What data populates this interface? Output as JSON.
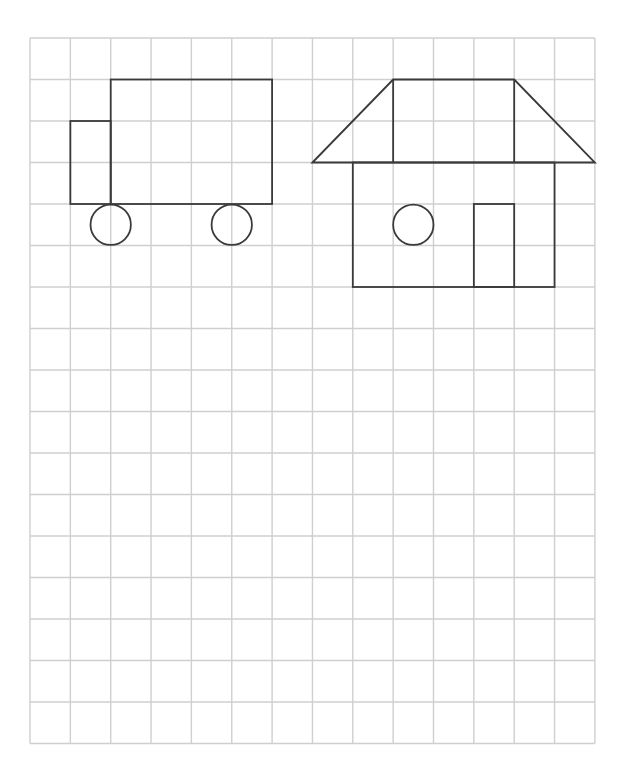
{
  "grid": {
    "left": 30,
    "top": 38,
    "cols": 14,
    "rows": 17,
    "cell_w": 40.35,
    "cell_h": 41.5,
    "line_color": "#cfcfcf",
    "stroke_color": "#3a3a3a"
  },
  "figures": [
    {
      "name": "truck",
      "parts": [
        {
          "type": "rect",
          "name": "truck-cab",
          "x1": 1,
          "y1": 2,
          "x2": 2,
          "y2": 4
        },
        {
          "type": "rect",
          "name": "truck-body",
          "x1": 2,
          "y1": 1,
          "x2": 6,
          "y2": 4
        },
        {
          "type": "circle",
          "name": "truck-wheel-front",
          "cx": 2,
          "cy": 4.5,
          "r": 0.5
        },
        {
          "type": "circle",
          "name": "truck-wheel-rear",
          "cx": 5,
          "cy": 4.5,
          "r": 0.5
        }
      ]
    },
    {
      "name": "house",
      "parts": [
        {
          "type": "polygon",
          "name": "house-roof",
          "points": [
            [
              7,
              3
            ],
            [
              9,
              1
            ],
            [
              12,
              1
            ],
            [
              14,
              3
            ]
          ]
        },
        {
          "type": "line",
          "name": "roof-divider-left",
          "x1": 9,
          "y1": 1,
          "x2": 9,
          "y2": 3
        },
        {
          "type": "line",
          "name": "roof-divider-right",
          "x1": 12,
          "y1": 1,
          "x2": 12,
          "y2": 3
        },
        {
          "type": "rect",
          "name": "house-walls",
          "x1": 8,
          "y1": 3,
          "x2": 13,
          "y2": 6
        },
        {
          "type": "circle",
          "name": "house-window",
          "cx": 9.5,
          "cy": 4.5,
          "r": 0.5
        },
        {
          "type": "rect",
          "name": "house-door",
          "x1": 11,
          "y1": 4,
          "x2": 12,
          "y2": 6
        }
      ]
    }
  ]
}
